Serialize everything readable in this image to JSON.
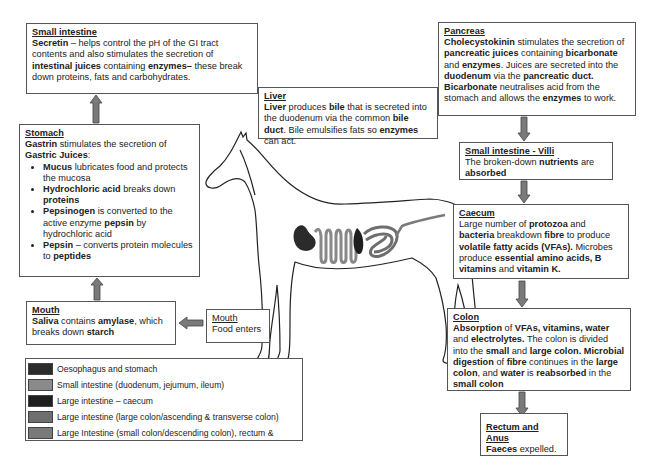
{
  "boxes": {
    "small_intestine_top": {
      "title": "Small intestine",
      "text": [
        {
          "t": "Secretin",
          "b": true
        },
        {
          "t": " – helps control the pH of the GI tract contents and also stimulates the secretion of ",
          "b": false
        },
        {
          "t": "intestinal juices",
          "b": true
        },
        {
          "t": " containing ",
          "b": false
        },
        {
          "t": "enzymes–",
          "b": true
        },
        {
          "t": " these break down proteins, fats and carbohydrates.",
          "b": false
        }
      ]
    },
    "stomach": {
      "title": "Stomach",
      "intro": [
        {
          "t": "Gastrin",
          "b": true
        },
        {
          "t": " stimulates the secretion of ",
          "b": false
        },
        {
          "t": "Gastric Juices",
          "b": true
        },
        {
          "t": ":",
          "b": false
        }
      ],
      "bullets": [
        [
          {
            "t": "Mucus",
            "b": true
          },
          {
            "t": " lubricates food and protects the mucosa",
            "b": false
          }
        ],
        [
          {
            "t": "Hydrochloric acid",
            "b": true
          },
          {
            "t": " breaks down ",
            "b": false
          },
          {
            "t": "proteins",
            "b": true
          }
        ],
        [
          {
            "t": "Pepsinogen",
            "b": true
          },
          {
            "t": " is converted to the active enzyme ",
            "b": false
          },
          {
            "t": "pepsin",
            "b": true
          },
          {
            "t": " by hydrochloric acid",
            "b": false
          }
        ],
        [
          {
            "t": "Pepsin",
            "b": true
          },
          {
            "t": " – converts protein molecules to ",
            "b": false
          },
          {
            "t": "peptides",
            "b": true
          }
        ]
      ]
    },
    "mouth": {
      "title": "Mouth",
      "text": [
        {
          "t": "Saliva",
          "b": true
        },
        {
          "t": " contains ",
          "b": false
        },
        {
          "t": "amylase",
          "b": true
        },
        {
          "t": ", which breaks down ",
          "b": false
        },
        {
          "t": "starch",
          "b": true
        }
      ]
    },
    "mouth_food": {
      "title": "Mouth",
      "text": [
        {
          "t": "Food enters",
          "b": false
        }
      ]
    },
    "liver": {
      "title": "Liver",
      "text": [
        {
          "t": "Liver",
          "b": true
        },
        {
          "t": " produces ",
          "b": false
        },
        {
          "t": "bile",
          "b": true
        },
        {
          "t": " that is secreted into the duodenum via the common ",
          "b": false
        },
        {
          "t": "bile duct",
          "b": true
        },
        {
          "t": ". Bile emulsifies fats so ",
          "b": false
        },
        {
          "t": "enzymes",
          "b": true
        },
        {
          "t": " can act.",
          "b": false
        }
      ]
    },
    "pancreas": {
      "title": "Pancreas",
      "text": [
        {
          "t": "Cholecystokinin",
          "b": true
        },
        {
          "t": " stimulates the secretion of ",
          "b": false
        },
        {
          "t": "pancreatic juices",
          "b": true
        },
        {
          "t": " containing ",
          "b": false
        },
        {
          "t": "bicarbonate",
          "b": true
        },
        {
          "t": " and ",
          "b": false
        },
        {
          "t": "enzymes",
          "b": true
        },
        {
          "t": ". Juices are secreted into the ",
          "b": false
        },
        {
          "t": "duodenum",
          "b": true
        },
        {
          "t": " via the ",
          "b": false
        },
        {
          "t": "pancreatic duct. Bicarbonate",
          "b": true
        },
        {
          "t": " neutralises acid from the stomach and allows the ",
          "b": false
        },
        {
          "t": "enzymes",
          "b": true
        },
        {
          "t": " to work.",
          "b": false
        }
      ]
    },
    "villi": {
      "title": "Small intestine - Villi",
      "title_bold": true,
      "text": [
        {
          "t": "The broken-down ",
          "b": false
        },
        {
          "t": "nutrients",
          "b": true
        },
        {
          "t": " are ",
          "b": false
        },
        {
          "t": "absorbed",
          "b": true
        }
      ]
    },
    "caecum": {
      "title": "Caecum",
      "text": [
        {
          "t": "Large number of ",
          "b": false
        },
        {
          "t": "protozoa",
          "b": true
        },
        {
          "t": " and ",
          "b": false
        },
        {
          "t": "bacteria",
          "b": true
        },
        {
          "t": " breakdown ",
          "b": false
        },
        {
          "t": "fibre",
          "b": true
        },
        {
          "t": " to produce ",
          "b": false
        },
        {
          "t": "volatile fatty acids (VFAs).",
          "b": true
        },
        {
          "t": " Microbes produce ",
          "b": false
        },
        {
          "t": "essential amino acids, B vitamins",
          "b": true
        },
        {
          "t": " and ",
          "b": false
        },
        {
          "t": "vitamin K.",
          "b": true
        }
      ]
    },
    "colon": {
      "title": "Colon",
      "text": [
        {
          "t": "Absorption",
          "b": true
        },
        {
          "t": " of ",
          "b": false
        },
        {
          "t": "VFAs, vitamins, water",
          "b": true
        },
        {
          "t": " and ",
          "b": false
        },
        {
          "t": "electrolytes.",
          "b": true
        },
        {
          "t": " The colon is divided into the ",
          "b": false
        },
        {
          "t": "small",
          "b": true
        },
        {
          "t": " and ",
          "b": false
        },
        {
          "t": "large colon.",
          "b": true
        },
        {
          "t": " ",
          "b": false
        },
        {
          "t": "Microbial digestion",
          "b": true
        },
        {
          "t": " of ",
          "b": false
        },
        {
          "t": "fibre",
          "b": true
        },
        {
          "t": " continues in the ",
          "b": false
        },
        {
          "t": "large colon",
          "b": true
        },
        {
          "t": ", and ",
          "b": false
        },
        {
          "t": "water",
          "b": true
        },
        {
          "t": " is ",
          "b": false
        },
        {
          "t": "reabsorbed",
          "b": true
        },
        {
          "t": " in the ",
          "b": false
        },
        {
          "t": "small colon",
          "b": true
        }
      ]
    },
    "rectum": {
      "title": "Rectum and Anus",
      "title_bold": true,
      "text": [
        {
          "t": "Faeces",
          "b": true
        },
        {
          "t": " expelled.",
          "b": false
        }
      ]
    }
  },
  "legend": [
    {
      "label": "Oesophagus and stomach",
      "color": "#2b2b2b"
    },
    {
      "label": "Small intestine (duodenum, jejumum, ileum)",
      "color": "#8a8a8a"
    },
    {
      "label": "Large intestine – caecum",
      "color": "#1e1e1e"
    },
    {
      "label": "Large intestine (large colon/ascending & transverse colon)",
      "color": "#6e6e6e"
    },
    {
      "label": "Large Intestine (small colon/descending colon), rectum &",
      "color": "#7a7a7a"
    }
  ],
  "colors": {
    "arrow": "#7a7a7a",
    "arrow_border": "#444444",
    "outline": "#222222"
  }
}
